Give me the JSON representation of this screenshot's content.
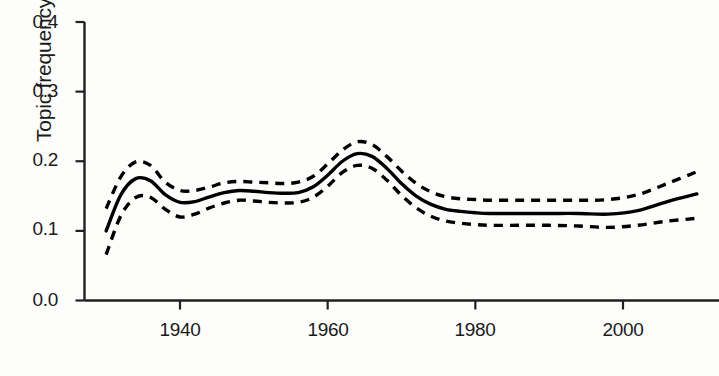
{
  "chart_data": {
    "type": "line",
    "title": "",
    "xlabel": "",
    "ylabel": "Topic frequency",
    "xlim": [
      1930,
      2010
    ],
    "ylim": [
      0.0,
      0.4
    ],
    "xticks": [
      1940,
      1960,
      1980,
      2000
    ],
    "xtick_labels": [
      "1940",
      "1960",
      "1980",
      "2000"
    ],
    "yticks": [
      0.0,
      0.1,
      0.2,
      0.3,
      0.4
    ],
    "ytick_labels": [
      "0.0",
      "0.1",
      "0.2",
      "0.3",
      "0.4"
    ],
    "grid": false,
    "legend": "none",
    "axis_color": "#231f20",
    "line_color": "#000000",
    "series": [
      {
        "name": "estimate",
        "style": "solid",
        "x": [
          1930,
          1932,
          1934,
          1936,
          1938,
          1940,
          1942,
          1944,
          1946,
          1948,
          1950,
          1952,
          1954,
          1956,
          1958,
          1960,
          1962,
          1964,
          1966,
          1968,
          1970,
          1972,
          1974,
          1976,
          1978,
          1980,
          1982,
          1986,
          1990,
          1994,
          1998,
          2002,
          2006,
          2010
        ],
        "values": [
          0.1,
          0.152,
          0.175,
          0.172,
          0.152,
          0.141,
          0.142,
          0.149,
          0.155,
          0.158,
          0.157,
          0.155,
          0.154,
          0.155,
          0.163,
          0.18,
          0.2,
          0.211,
          0.207,
          0.19,
          0.168,
          0.15,
          0.138,
          0.131,
          0.128,
          0.126,
          0.125,
          0.125,
          0.125,
          0.125,
          0.124,
          0.129,
          0.142,
          0.153
        ]
      },
      {
        "name": "upper confidence bound",
        "style": "dashed",
        "x": [
          1930,
          1932,
          1934,
          1936,
          1938,
          1940,
          1942,
          1944,
          1946,
          1948,
          1950,
          1952,
          1954,
          1956,
          1958,
          1960,
          1962,
          1964,
          1966,
          1968,
          1970,
          1972,
          1974,
          1976,
          1978,
          1980,
          1982,
          1986,
          1990,
          1994,
          1998,
          2002,
          2006,
          2010
        ],
        "values": [
          0.132,
          0.178,
          0.199,
          0.194,
          0.17,
          0.158,
          0.158,
          0.163,
          0.169,
          0.171,
          0.17,
          0.169,
          0.168,
          0.17,
          0.178,
          0.196,
          0.216,
          0.228,
          0.224,
          0.207,
          0.186,
          0.168,
          0.156,
          0.149,
          0.146,
          0.145,
          0.144,
          0.144,
          0.144,
          0.144,
          0.145,
          0.152,
          0.168,
          0.185
        ]
      },
      {
        "name": "lower confidence bound",
        "style": "dashed",
        "x": [
          1930,
          1932,
          1934,
          1936,
          1938,
          1940,
          1942,
          1944,
          1946,
          1948,
          1950,
          1952,
          1954,
          1956,
          1958,
          1960,
          1962,
          1964,
          1966,
          1968,
          1970,
          1972,
          1974,
          1976,
          1978,
          1980,
          1982,
          1986,
          1990,
          1994,
          1998,
          2002,
          2006,
          2010
        ],
        "values": [
          0.066,
          0.122,
          0.148,
          0.148,
          0.131,
          0.12,
          0.124,
          0.133,
          0.14,
          0.144,
          0.143,
          0.141,
          0.14,
          0.141,
          0.148,
          0.164,
          0.184,
          0.194,
          0.19,
          0.173,
          0.151,
          0.133,
          0.121,
          0.114,
          0.111,
          0.109,
          0.108,
          0.108,
          0.108,
          0.107,
          0.105,
          0.108,
          0.114,
          0.118
        ]
      }
    ]
  }
}
